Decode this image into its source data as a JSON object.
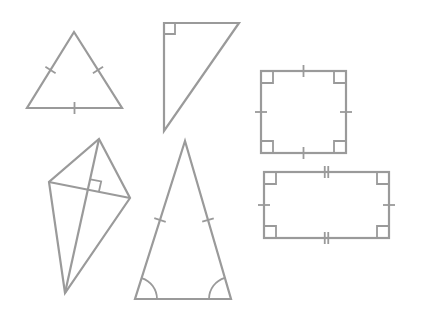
{
  "figure": {
    "width": 424,
    "height": 319,
    "background": "#ffffff",
    "stroke_color": "#9a9a9a"
  },
  "shapes": [
    {
      "name": "equilateral-triangle",
      "type": "triangle",
      "points": [
        [
          74,
          32
        ],
        [
          122,
          108
        ],
        [
          27,
          108
        ]
      ],
      "tick_marks": 1,
      "ticks_on": [
        "left",
        "right",
        "base"
      ]
    },
    {
      "name": "right-triangle",
      "type": "triangle",
      "points": [
        [
          164,
          23
        ],
        [
          239,
          23
        ],
        [
          164,
          131
        ]
      ],
      "right_angle_at": [
        164,
        23
      ]
    },
    {
      "name": "square",
      "type": "quadrilateral",
      "rect": {
        "x": 261,
        "y": 71,
        "w": 85,
        "h": 82
      },
      "tick_marks": 1,
      "right_angles": 4
    },
    {
      "name": "kite",
      "type": "quadrilateral",
      "points": [
        [
          99,
          139
        ],
        [
          130,
          198
        ],
        [
          65,
          293
        ],
        [
          49,
          182
        ]
      ],
      "diagonals": true,
      "right_angle_at_intersection": true
    },
    {
      "name": "isosceles-triangle",
      "type": "triangle",
      "points": [
        [
          185,
          141
        ],
        [
          231,
          299
        ],
        [
          135,
          299
        ]
      ],
      "tick_marks": 1,
      "ticks_on": [
        "left",
        "right"
      ],
      "base_angles_marked": true
    },
    {
      "name": "rectangle",
      "type": "quadrilateral",
      "rect": {
        "x": 264,
        "y": 172,
        "w": 125,
        "h": 66
      },
      "long_side_ticks": 2,
      "short_side_ticks": 1,
      "right_angles": 4
    }
  ]
}
